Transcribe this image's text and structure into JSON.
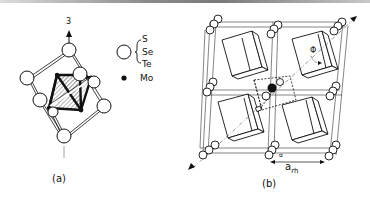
{
  "figure": {
    "panel_a": {
      "caption": "(a)",
      "axis_label": "3",
      "legend": {
        "open_circle_species": [
          "S",
          "Se",
          "Te"
        ],
        "filled_circle_species": "Mo"
      }
    },
    "panel_b": {
      "caption": "(b)",
      "angle_label": "Φ",
      "alpha_label": "α",
      "lattice_label_main": "a",
      "lattice_label_sub": "rh"
    },
    "colors": {
      "ink": "#111111",
      "paper": "#ffffff",
      "hatch": "#555555"
    }
  }
}
